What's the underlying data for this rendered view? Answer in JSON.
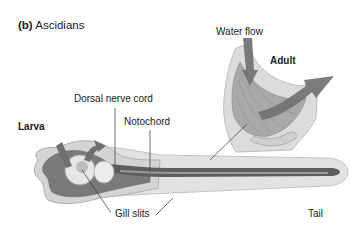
{
  "figure": {
    "panel_letter": "(b)",
    "panel_title": "Ascidians",
    "labels": {
      "water_flow": "Water flow",
      "adult": "Adult",
      "larva": "Larva",
      "dorsal_nerve_cord": "Dorsal nerve cord",
      "notochord": "Notochord",
      "gill_slits": "Gill slits",
      "tail": "Tail"
    },
    "colors": {
      "body_light": "#e4e4e4",
      "body_mid": "#b5b5b5",
      "body_dark": "#6f6f6f",
      "arrow": "#6a6a6a",
      "leader_line": "#333333",
      "text": "#222222"
    }
  }
}
